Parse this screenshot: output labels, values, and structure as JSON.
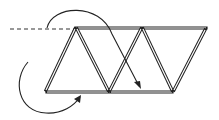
{
  "diagram": {
    "title": "",
    "colors": {
      "stroke": "#222222",
      "background": "#ffffff"
    },
    "sticks": [
      {
        "id": "top-left",
        "x1": 76,
        "y1": 28,
        "x2": 140,
        "y2": 28
      },
      {
        "id": "top-right",
        "x1": 143,
        "y1": 28,
        "x2": 206,
        "y2": 28
      },
      {
        "id": "bottom-left",
        "x1": 47,
        "y1": 92,
        "x2": 108,
        "y2": 92
      },
      {
        "id": "bottom-right",
        "x1": 111,
        "y1": 92,
        "x2": 172,
        "y2": 92
      },
      {
        "id": "diag-1",
        "x1": 75,
        "y1": 29,
        "x2": 46,
        "y2": 90
      },
      {
        "id": "diag-2",
        "x1": 77,
        "y1": 29,
        "x2": 108,
        "y2": 90
      },
      {
        "id": "diag-3",
        "x1": 141,
        "y1": 29,
        "x2": 110,
        "y2": 90
      },
      {
        "id": "diag-4",
        "x1": 143,
        "y1": 29,
        "x2": 172,
        "y2": 90
      },
      {
        "id": "diag-5",
        "x1": 205,
        "y1": 30,
        "x2": 174,
        "y2": 90
      }
    ],
    "dashed_triangle": {
      "points": "10,29 74,29 46,90"
    },
    "arrows": [
      {
        "id": "top-arc-arrow",
        "path": "M47,28 C52,5 100,2 112,34 L139,86",
        "head": "141,89 134,82 140,81"
      },
      {
        "id": "bottom-arc-arrow",
        "path": "M28,62 C12,80 18,112 46,113 C62,114 74,106 80,97",
        "head": "81,95 74,99 80,103"
      }
    ]
  }
}
